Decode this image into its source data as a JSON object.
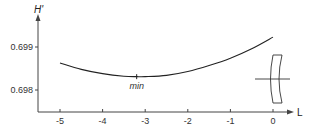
{
  "chart_data": {
    "type": "line",
    "title": "",
    "xlabel": "L",
    "ylabel": "H'",
    "xlim": [
      -5.5,
      0.4
    ],
    "ylim": [
      0.6975,
      0.6996
    ],
    "grid": false,
    "legend": null,
    "x_ticks": [
      -5,
      -4,
      -3,
      -2,
      -1,
      0
    ],
    "x_tick_labels": [
      "-5",
      "-4",
      "-3",
      "-2",
      "-1",
      "0"
    ],
    "y_ticks": [
      0.698,
      0.699
    ],
    "y_tick_labels": [
      "0.698",
      "0.699"
    ],
    "series": [
      {
        "name": "H'",
        "x": [
          -5,
          -4.5,
          -4,
          -3.5,
          -3.2,
          -3,
          -2.5,
          -2,
          -1.5,
          -1,
          -0.5,
          0
        ],
        "y": [
          0.69863,
          0.69848,
          0.69838,
          0.69832,
          0.69831,
          0.69831,
          0.69834,
          0.69843,
          0.69857,
          0.69874,
          0.69896,
          0.69923
        ]
      }
    ],
    "annotations": [
      {
        "text": "min",
        "x": -3.2,
        "y": 0.69831,
        "marker": "tick"
      }
    ],
    "inset_icon": "lens-cross-section-icon"
  }
}
